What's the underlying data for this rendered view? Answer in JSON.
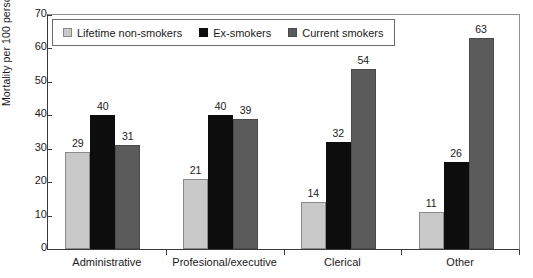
{
  "chart_data": {
    "type": "bar",
    "title": "",
    "xlabel": "",
    "ylabel": "Mortality per 100 persons",
    "ylim": [
      0,
      70
    ],
    "yticks": [
      0,
      10,
      20,
      30,
      40,
      50,
      60,
      70
    ],
    "grid": false,
    "legend_position": "top-left-inside",
    "categories": [
      "Administrative",
      "Profesional/executive",
      "Clerical",
      "Other"
    ],
    "series": [
      {
        "name": "Lifetime non-smokers",
        "color": "#c9c9c9",
        "values": [
          29,
          21,
          14,
          11
        ]
      },
      {
        "name": "Ex-smokers",
        "color": "#0d0d0d",
        "values": [
          40,
          40,
          32,
          26
        ]
      },
      {
        "name": "Current smokers",
        "color": "#5b5b5b",
        "values": [
          31,
          39,
          54,
          63
        ]
      }
    ]
  },
  "legend": {
    "items": [
      {
        "label": "Lifetime non-smokers"
      },
      {
        "label": "Ex-smokers"
      },
      {
        "label": "Current smokers"
      }
    ]
  },
  "axes": {
    "y_title": "Mortality per 100 persons"
  }
}
